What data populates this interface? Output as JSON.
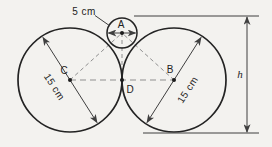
{
  "figure": {
    "labels": {
      "small_diameter": "5 cm",
      "left_diameter": "15 cm",
      "right_diameter": "15 cm",
      "center_small": "A",
      "center_right": "B",
      "center_left": "C",
      "tangent_point": "D",
      "height": "h"
    },
    "colors": {
      "background": "#f3f2ef",
      "outline": "#232323",
      "dimension_lines": "#3f3f3f",
      "dashed_lines": "#8f8f8f"
    },
    "geometry": {
      "small_circle_diameter_cm": 5,
      "large_circle_diameter_cm": 15,
      "points": [
        "A",
        "B",
        "C",
        "D"
      ],
      "height_symbol": "h"
    }
  }
}
